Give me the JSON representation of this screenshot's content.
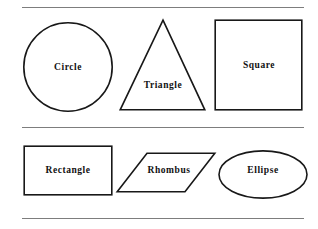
{
  "document": {
    "title": "Geometric Shapes Reference",
    "background_color": "#ffffff",
    "stroke_color": "#181818",
    "rule_color": "#7d7d7d",
    "text_color": "#111111"
  },
  "rules": [
    {
      "id": "rule-top",
      "label": "top-divider"
    },
    {
      "id": "rule-middle",
      "label": "middle-divider"
    },
    {
      "id": "rule-bottom",
      "label": "bottom-divider"
    }
  ],
  "rows": [
    {
      "name": "upper-row",
      "shapes": [
        {
          "id": "circle",
          "label": "Circle",
          "kind": "circle"
        },
        {
          "id": "triangle",
          "label": "Triangle",
          "kind": "triangle"
        },
        {
          "id": "square",
          "label": "Square",
          "kind": "square"
        }
      ]
    },
    {
      "name": "lower-row",
      "shapes": [
        {
          "id": "rectangle",
          "label": "Rectangle",
          "kind": "rectangle"
        },
        {
          "id": "rhombus",
          "label": "Rhombus",
          "kind": "parallelogram"
        },
        {
          "id": "ellipse",
          "label": "Ellipse",
          "kind": "ellipse"
        }
      ]
    }
  ]
}
